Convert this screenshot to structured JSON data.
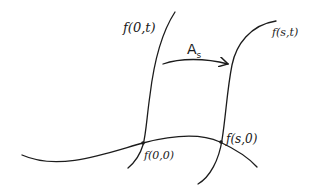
{
  "diagram": {
    "labels": {
      "f0t": "f(0,t)",
      "fst": "f(s,t)",
      "f00": "f(0,0)",
      "fs0": "f(s,0)",
      "map": "A",
      "map_sub": "s"
    },
    "colors": {
      "ink": "#1c1c1c",
      "background": "#ffffff"
    }
  }
}
